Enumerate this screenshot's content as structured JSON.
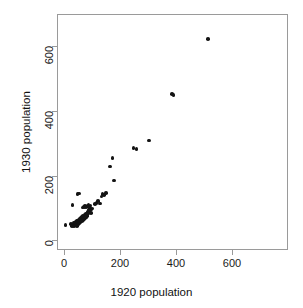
{
  "figure": {
    "width": 303,
    "height": 308,
    "background": "#ffffff",
    "panel_border_color": "#9a9a9a",
    "point_color": "#141414",
    "point_style": "filled-circle"
  },
  "chart_data": {
    "type": "scatter",
    "title": "",
    "subtitle": "",
    "xlabel": "1920 population",
    "ylabel": "1930 population",
    "xlim": [
      -25,
      800
    ],
    "ylim": [
      -30,
      700
    ],
    "xticks": [
      0,
      200,
      400,
      600
    ],
    "yticks": [
      0,
      200,
      400,
      600
    ],
    "xticklabels": [
      "0",
      "200",
      "400",
      "600"
    ],
    "yticklabels": [
      "0",
      "200",
      "400",
      "600"
    ],
    "grid": false,
    "legend": null,
    "legend_position": "none",
    "annotations": [],
    "series": [
      {
        "name": "cities",
        "marker": "filled-circle",
        "color": "#141414",
        "points": [
          [
            2,
            50
          ],
          [
            22,
            54
          ],
          [
            25,
            48
          ],
          [
            27,
            113
          ],
          [
            29,
            52
          ],
          [
            30,
            50
          ],
          [
            31,
            56
          ],
          [
            33,
            47
          ],
          [
            34,
            51
          ],
          [
            35,
            58
          ],
          [
            36,
            49
          ],
          [
            37,
            54
          ],
          [
            38,
            60
          ],
          [
            39,
            50
          ],
          [
            40,
            57
          ],
          [
            41,
            53
          ],
          [
            42,
            62
          ],
          [
            43,
            48
          ],
          [
            44,
            58
          ],
          [
            45,
            64
          ],
          [
            46,
            55
          ],
          [
            47,
            60
          ],
          [
            48,
            52
          ],
          [
            49,
            66
          ],
          [
            50,
            58
          ],
          [
            51,
            63
          ],
          [
            52,
            56
          ],
          [
            53,
            70
          ],
          [
            54,
            61
          ],
          [
            55,
            67
          ],
          [
            56,
            59
          ],
          [
            57,
            72
          ],
          [
            58,
            64
          ],
          [
            59,
            69
          ],
          [
            60,
            62
          ],
          [
            61,
            75
          ],
          [
            62,
            68
          ],
          [
            63,
            71
          ],
          [
            64,
            66
          ],
          [
            65,
            78
          ],
          [
            66,
            70
          ],
          [
            67,
            74
          ],
          [
            68,
            69
          ],
          [
            69,
            81
          ],
          [
            70,
            73
          ],
          [
            71,
            77
          ],
          [
            72,
            72
          ],
          [
            73,
            84
          ],
          [
            74,
            76
          ],
          [
            75,
            80
          ],
          [
            76,
            75
          ],
          [
            77,
            86
          ],
          [
            78,
            79
          ],
          [
            79,
            83
          ],
          [
            80,
            88
          ],
          [
            81,
            82
          ],
          [
            82,
            91
          ],
          [
            83,
            86
          ],
          [
            84,
            95
          ],
          [
            85,
            89
          ],
          [
            86,
            99
          ],
          [
            87,
            93
          ],
          [
            88,
            101
          ],
          [
            89,
            96
          ],
          [
            90,
            104
          ],
          [
            92,
            88
          ],
          [
            95,
            99
          ],
          [
            98,
            102
          ],
          [
            44,
            146
          ],
          [
            50,
            148
          ],
          [
            63,
            104
          ],
          [
            68,
            107
          ],
          [
            72,
            110
          ],
          [
            76,
            106
          ],
          [
            80,
            109
          ],
          [
            84,
            112
          ],
          [
            88,
            108
          ],
          [
            91,
            111
          ],
          [
            108,
            116
          ],
          [
            112,
            119
          ],
          [
            118,
            124
          ],
          [
            125,
            117
          ],
          [
            130,
            139
          ],
          [
            134,
            146
          ],
          [
            140,
            143
          ],
          [
            146,
            149
          ],
          [
            160,
            232
          ],
          [
            170,
            258
          ],
          [
            175,
            188
          ],
          [
            245,
            288
          ],
          [
            255,
            286
          ],
          [
            300,
            312
          ],
          [
            383,
            456
          ],
          [
            388,
            452
          ],
          [
            510,
            625
          ]
        ]
      }
    ]
  },
  "axes": {
    "x": {
      "label": "1920 population",
      "ticks": [
        {
          "value": 0,
          "label": "0"
        },
        {
          "value": 200,
          "label": "200"
        },
        {
          "value": 400,
          "label": "400"
        },
        {
          "value": 600,
          "label": "600"
        }
      ]
    },
    "y": {
      "label": "1930 population",
      "ticks": [
        {
          "value": 0,
          "label": "0"
        },
        {
          "value": 200,
          "label": "200"
        },
        {
          "value": 400,
          "label": "400"
        },
        {
          "value": 600,
          "label": "600"
        }
      ]
    }
  }
}
